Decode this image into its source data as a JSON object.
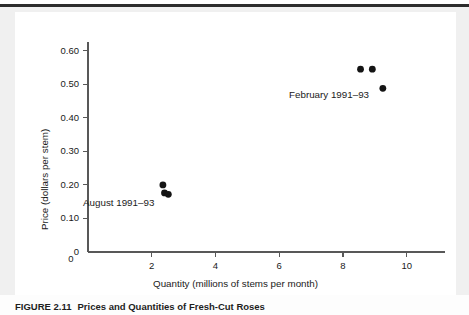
{
  "figure": {
    "caption_number": "FIGURE 2.11",
    "caption_title": "Prices and Quantities of Fresh-Cut Roses"
  },
  "chart_data": {
    "type": "scatter",
    "title": "",
    "xlabel": "Quantity (millions of stems per month)",
    "ylabel": "Price (dollars per stem)",
    "xlim": [
      0,
      11.2
    ],
    "ylim": [
      0,
      0.65
    ],
    "xticks": [
      0,
      2,
      4,
      6,
      8,
      10
    ],
    "xticklabels": [
      "0",
      "2",
      "4",
      "6",
      "8",
      "10"
    ],
    "yticks": [
      0,
      0.1,
      0.2,
      0.3,
      0.4,
      0.5,
      0.6
    ],
    "yticklabels": [
      "0",
      "0.10",
      "0.20",
      "0.30",
      "0.40",
      "0.50",
      "0.60"
    ],
    "grid": false,
    "legend": "none",
    "marker_color": "#141414",
    "marker_size": 3.4,
    "series": [
      {
        "name": "August 1991-93",
        "annotation": "August 1991–93",
        "points": [
          {
            "x": 2.35,
            "y": 0.2
          },
          {
            "x": 2.4,
            "y": 0.176
          },
          {
            "x": 2.52,
            "y": 0.172
          }
        ]
      },
      {
        "name": "February 1991-93",
        "annotation": "February 1991–93",
        "points": [
          {
            "x": 8.55,
            "y": 0.545
          },
          {
            "x": 8.92,
            "y": 0.545
          },
          {
            "x": 9.25,
            "y": 0.488
          }
        ]
      }
    ]
  }
}
